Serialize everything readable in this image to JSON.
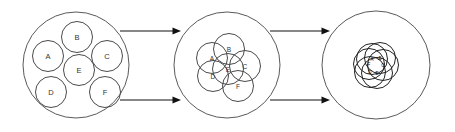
{
  "figure": {
    "background_color": "#ffffff",
    "stroke_color": "#4a4a4a",
    "outer_stroke_color": "#5a5a5a",
    "arrow_color": "#111111",
    "width": 455,
    "height": 132
  },
  "chart_data": {
    "type": "diagram",
    "member_labels": [
      "A",
      "B",
      "C",
      "D",
      "E",
      "F"
    ],
    "stage_count": 3,
    "arrow_count": 4
  },
  "stages": [
    {
      "id": "stage-1",
      "name": "initial-packing",
      "outer": {
        "cx": 76,
        "cy": 65,
        "r": 53
      },
      "member_radius": 15.5,
      "members": [
        {
          "label": "A",
          "cx": 48,
          "cy": 56
        },
        {
          "label": "B",
          "cx": 77,
          "cy": 37
        },
        {
          "label": "C",
          "cx": 107,
          "cy": 56
        },
        {
          "label": "D",
          "cx": 51,
          "cy": 92
        },
        {
          "label": "E",
          "cx": 79,
          "cy": 70
        },
        {
          "label": "F",
          "cx": 105,
          "cy": 92
        }
      ]
    },
    {
      "id": "stage-2",
      "name": "partial-contraction",
      "outer": {
        "cx": 227,
        "cy": 65,
        "r": 53
      },
      "member_radius": 15.5,
      "members": [
        {
          "label": "A",
          "cx": 212,
          "cy": 58
        },
        {
          "label": "B",
          "cx": 229,
          "cy": 49
        },
        {
          "label": "C",
          "cx": 245,
          "cy": 66
        },
        {
          "label": "D",
          "cx": 213,
          "cy": 76
        },
        {
          "label": "E",
          "cx": 228,
          "cy": 69
        },
        {
          "label": "F",
          "cx": 238,
          "cy": 86
        }
      ]
    },
    {
      "id": "stage-3",
      "name": "full-convergence",
      "outer": {
        "cx": 376,
        "cy": 65,
        "r": 54
      },
      "member_radius": 15.5,
      "members": [
        {
          "label": "A",
          "cx": 372,
          "cy": 59
        },
        {
          "label": "B",
          "cx": 380,
          "cy": 58
        },
        {
          "label": "C",
          "cx": 383,
          "cy": 65
        },
        {
          "label": "D",
          "cx": 370,
          "cy": 72
        },
        {
          "label": "E",
          "cx": 377,
          "cy": 73
        },
        {
          "label": "F",
          "cx": 369,
          "cy": 64
        }
      ]
    }
  ],
  "arrows": [
    {
      "id": "arrow-top-left",
      "x1": 120,
      "y1": 31,
      "x2": 181,
      "y2": 31
    },
    {
      "id": "arrow-bottom-left",
      "x1": 120,
      "y1": 100,
      "x2": 181,
      "y2": 100
    },
    {
      "id": "arrow-top-right",
      "x1": 270,
      "y1": 31,
      "x2": 330,
      "y2": 31
    },
    {
      "id": "arrow-bottom-right",
      "x1": 270,
      "y1": 100,
      "x2": 330,
      "y2": 100
    }
  ]
}
